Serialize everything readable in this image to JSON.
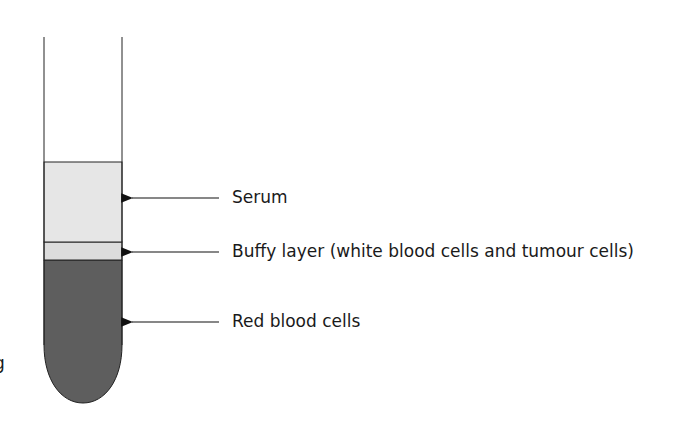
{
  "diagram": {
    "type": "centrifuged blood tube",
    "colors": {
      "serum": "#e6e6e6",
      "buffy": "#dcdcdc",
      "red_cells": "#5e5e5e",
      "outline": "#222222"
    },
    "labels": [
      {
        "id": "serum",
        "text": "Serum"
      },
      {
        "id": "buffy",
        "text": "Buffy layer (white blood cells and tumour cells)"
      },
      {
        "id": "red",
        "text": "Red blood cells"
      }
    ],
    "stray_mark": "g"
  }
}
